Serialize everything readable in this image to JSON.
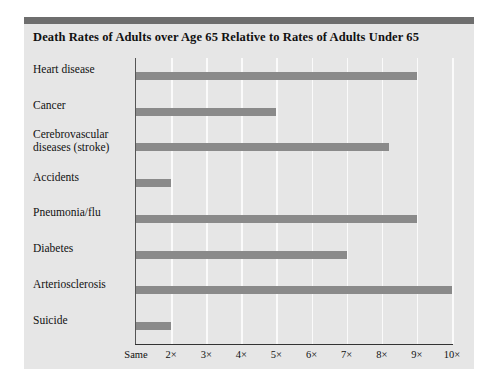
{
  "chart_data": {
    "type": "bar",
    "orientation": "horizontal",
    "title": "Death Rates of Adults over Age 65 Relative to Rates of Adults Under 65",
    "xlabel": "",
    "ylabel": "",
    "categories": [
      "Heart disease",
      "Cancer",
      "Cerebrovascular diseases (stroke)",
      "Accidents",
      "Pneumonia/flu",
      "Diabetes",
      "Arteriosclerosis",
      "Suicide"
    ],
    "values": [
      9,
      5,
      8.2,
      2,
      9,
      7,
      10,
      2
    ],
    "xlim": [
      1,
      10
    ],
    "xtick_values": [
      1,
      2,
      3,
      4,
      5,
      6,
      7,
      8,
      9,
      10
    ],
    "xtick_labels": [
      "Same",
      "2×",
      "3×",
      "4×",
      "5×",
      "6×",
      "7×",
      "8×",
      "9×",
      "10×"
    ],
    "grid": true,
    "gridline_axis": "x",
    "legend": null,
    "bar_color": "#8a8a8a",
    "panel_color": "#e6e6e6",
    "gridline_color": "#fafafa",
    "accent_bar_color": "#6e6e6e"
  },
  "category_label_lines": [
    [
      "Heart disease"
    ],
    [
      "Cancer"
    ],
    [
      "Cerebrovascular",
      "diseases (stroke)"
    ],
    [
      "Accidents"
    ],
    [
      "Pneumonia/flu"
    ],
    [
      "Diabetes"
    ],
    [
      "Arteriosclerosis"
    ],
    [
      "Suicide"
    ]
  ]
}
